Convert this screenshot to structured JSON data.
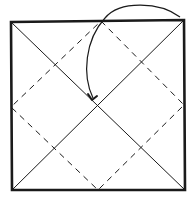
{
  "diagram": {
    "type": "origami-fold-diagram",
    "colors": {
      "background": "#ffffff",
      "stroke": "#1a1a1a"
    },
    "square": {
      "corners": [
        [
          11,
          22
        ],
        [
          184,
          20
        ],
        [
          185,
          190
        ],
        [
          12,
          190
        ]
      ],
      "stroke_width": 2.6
    },
    "diagonals": [
      {
        "from": [
          11,
          22
        ],
        "to": [
          185,
          190
        ]
      },
      {
        "from": [
          184,
          20
        ],
        "to": [
          12,
          190
        ]
      }
    ],
    "dashed_diamond": {
      "points": [
        [
          101,
          21
        ],
        [
          184,
          105
        ],
        [
          98,
          190
        ],
        [
          11,
          107
        ]
      ],
      "dash": "6,5"
    },
    "fold_arrow": {
      "start": [
        180,
        17
      ],
      "control1": [
        140,
        -6
      ],
      "control2": [
        60,
        20
      ],
      "end": [
        92,
        99
      ],
      "arrowhead": "bent-tick"
    }
  }
}
